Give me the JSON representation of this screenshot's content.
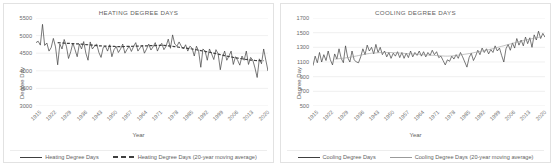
{
  "chart_data": [
    {
      "type": "line",
      "title": "HEATING DEGREE DAYS",
      "xlabel": "Year",
      "ylabel": "Degree Day",
      "ylim": [
        3000,
        5500
      ],
      "yticks": [
        3000,
        3500,
        4000,
        4500,
        5000,
        5500
      ],
      "xlim": [
        1915,
        2022
      ],
      "xticks": [
        1915,
        1922,
        1929,
        1936,
        1943,
        1950,
        1957,
        1964,
        1971,
        1978,
        1985,
        1992,
        1999,
        2006,
        2013,
        2020
      ],
      "grid": true,
      "legend_position": "bottom",
      "series": [
        {
          "name": "Heating Degree Days",
          "style": "solid",
          "color": "#3f3f3f",
          "x_start": 1915,
          "values": [
            4800,
            4840,
            4730,
            5320,
            4720,
            4790,
            4560,
            4660,
            4920,
            4680,
            4170,
            4760,
            4620,
            4890,
            4700,
            4350,
            4540,
            4790,
            4600,
            4400,
            4760,
            4620,
            4830,
            4500,
            4300,
            4820,
            4620,
            4700,
            4760,
            4520,
            4380,
            4660,
            4700,
            4560,
            4740,
            4400,
            4600,
            4690,
            4520,
            4620,
            4760,
            4500,
            4610,
            4700,
            4550,
            4690,
            4800,
            4560,
            4650,
            4730,
            4500,
            4620,
            4760,
            4590,
            4680,
            4800,
            4560,
            4700,
            4780,
            4600,
            4700,
            4900,
            4640,
            5020,
            4760,
            4700,
            4820,
            4700,
            4620,
            4740,
            4560,
            4700,
            4640,
            4420,
            4700,
            4560,
            4100,
            4620,
            4560,
            4300,
            4620,
            4480,
            4320,
            4600,
            4480,
            4030,
            4380,
            4560,
            4300,
            4420,
            4560,
            4180,
            4400,
            4300,
            4160,
            4420,
            4300,
            4560,
            4180,
            4380,
            4300,
            4080,
            3810,
            4340,
            4200,
            4620,
            4300,
            4000,
            4280,
            4320
          ]
        },
        {
          "name": "Heating Degree Days (20-year moving average)",
          "style": "dashed",
          "color": "#3f3f3f",
          "x_start": 1925,
          "values": [
            4800,
            4795,
            4790,
            4785,
            4782,
            4780,
            4776,
            4772,
            4768,
            4765,
            4762,
            4758,
            4752,
            4746,
            4740,
            4734,
            4728,
            4722,
            4716,
            4710,
            4706,
            4702,
            4700,
            4698,
            4696,
            4694,
            4692,
            4690,
            4688,
            4688,
            4688,
            4690,
            4692,
            4694,
            4696,
            4698,
            4700,
            4702,
            4704,
            4706,
            4708,
            4710,
            4712,
            4714,
            4716,
            4718,
            4720,
            4722,
            4722,
            4720,
            4716,
            4710,
            4702,
            4694,
            4686,
            4678,
            4670,
            4662,
            4654,
            4646,
            4638,
            4630,
            4620,
            4610,
            4598,
            4586,
            4574,
            4562,
            4550,
            4538,
            4526,
            4514,
            4500,
            4486,
            4472,
            4458,
            4444,
            4430,
            4418,
            4406,
            4394,
            4382,
            4372,
            4362,
            4352,
            4342,
            4332,
            4322,
            4314,
            4306,
            4300,
            4294,
            4290,
            4288,
            4288,
            4290
          ]
        }
      ]
    },
    {
      "type": "line",
      "title": "COOLING DEGREE DAYS",
      "xlabel": "Year",
      "ylabel": "Degree Day",
      "ylim": [
        500,
        1700
      ],
      "yticks": [
        500,
        700,
        900,
        1100,
        1300,
        1500,
        1700
      ],
      "xlim": [
        1915,
        2022
      ],
      "xticks": [
        1915,
        1922,
        1929,
        1936,
        1943,
        1950,
        1957,
        1964,
        1971,
        1978,
        1985,
        1992,
        1999,
        2006,
        2013,
        2020
      ],
      "grid": true,
      "legend_position": "bottom",
      "series": [
        {
          "name": "Cooling Degree Days",
          "style": "solid",
          "color": "#3f3f3f",
          "x_start": 1915,
          "values": [
            1050,
            1180,
            1090,
            1230,
            1100,
            1200,
            1120,
            1250,
            1130,
            1060,
            1210,
            1140,
            1280,
            1150,
            1090,
            1320,
            1160,
            1100,
            1250,
            1130,
            1100,
            1090,
            1170,
            1280,
            1200,
            1330,
            1250,
            1300,
            1210,
            1340,
            1230,
            1300,
            1200,
            1250,
            1170,
            1230,
            1150,
            1220,
            1180,
            1240,
            1160,
            1230,
            1150,
            1220,
            1160,
            1250,
            1170,
            1230,
            1190,
            1250,
            1180,
            1240,
            1170,
            1230,
            1190,
            1260,
            1200,
            1240,
            1160,
            1180,
            1120,
            1060,
            1130,
            1110,
            1180,
            1140,
            1200,
            1150,
            1230,
            1170,
            1100,
            1030,
            1160,
            1220,
            1120,
            1180,
            1260,
            1200,
            1290,
            1230,
            1280,
            1210,
            1270,
            1230,
            1320,
            1250,
            1290,
            1190,
            1100,
            1280,
            1340,
            1260,
            1360,
            1290,
            1420,
            1330,
            1400,
            1320,
            1440,
            1350,
            1430,
            1300,
            1470,
            1400,
            1520,
            1420,
            1490,
            1440,
            1520,
            1500
          ]
        },
        {
          "name": "Cooling Degree Days (20-year moving average)",
          "style": "thin",
          "color": "#9a9a9a",
          "x_start": 1925,
          "values": [
            1140,
            1142,
            1145,
            1148,
            1152,
            1156,
            1160,
            1165,
            1170,
            1176,
            1182,
            1188,
            1194,
            1200,
            1206,
            1212,
            1216,
            1220,
            1222,
            1224,
            1226,
            1228,
            1229,
            1230,
            1230,
            1230,
            1229,
            1228,
            1226,
            1224,
            1222,
            1220,
            1218,
            1216,
            1214,
            1212,
            1210,
            1208,
            1206,
            1204,
            1202,
            1200,
            1198,
            1196,
            1194,
            1192,
            1190,
            1188,
            1186,
            1184,
            1182,
            1180,
            1180,
            1181,
            1183,
            1186,
            1190,
            1194,
            1198,
            1202,
            1206,
            1210,
            1215,
            1220,
            1226,
            1232,
            1238,
            1244,
            1250,
            1256,
            1262,
            1268,
            1275,
            1282,
            1290,
            1298,
            1306,
            1314,
            1322,
            1330,
            1338,
            1346,
            1354,
            1362,
            1370,
            1378,
            1386,
            1394,
            1400,
            1406,
            1412,
            1418,
            1424,
            1430,
            1436,
            1442
          ]
        }
      ]
    }
  ],
  "panels": [
    {
      "title": "HEATING DEGREE DAYS",
      "ylabel": "Degree Day",
      "xlabel": "Year",
      "legend": [
        {
          "label": "Heating Degree Days",
          "style": "solid"
        },
        {
          "label": "Heating Degree Days (20-year moving average)",
          "style": "dashed"
        }
      ]
    },
    {
      "title": "COOLING DEGREE DAYS",
      "ylabel": "Degree Day",
      "xlabel": "Year",
      "legend": [
        {
          "label": "Cooling Degree Days",
          "style": "solid"
        },
        {
          "label": "Cooling Degree Days (20-year moving average)",
          "style": "thin"
        }
      ]
    }
  ]
}
